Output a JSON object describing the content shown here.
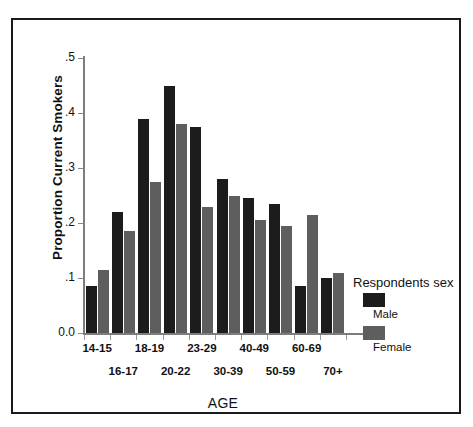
{
  "chart_data": {
    "type": "bar",
    "title": "",
    "xlabel": "AGE",
    "ylabel": "Proportion Current Smokers",
    "categories": [
      "14-15",
      "16-17",
      "18-19",
      "20-22",
      "23-29",
      "30-39",
      "40-49",
      "50-59",
      "60-69",
      "70+"
    ],
    "series": [
      {
        "name": "Male",
        "color": "#1c1c1c",
        "values": [
          0.085,
          0.22,
          0.39,
          0.45,
          0.375,
          0.28,
          0.245,
          0.235,
          0.085,
          0.1
        ]
      },
      {
        "name": "Female",
        "color": "#5e5e5e",
        "values": [
          0.115,
          0.185,
          0.275,
          0.38,
          0.23,
          0.25,
          0.205,
          0.195,
          0.215,
          0.11
        ]
      }
    ],
    "ylim": [
      0.0,
      0.5
    ],
    "yticks": [
      0.0,
      0.1,
      0.2,
      0.3,
      0.4,
      0.5
    ],
    "ytick_labels": [
      "0.0",
      ".1",
      ".2",
      ".3",
      ".4",
      ".5"
    ],
    "grid": false,
    "legend_position": "right",
    "legend_title": "Respondents sex"
  },
  "legend": {
    "title": "Respondents sex",
    "entries": [
      {
        "label": "Male",
        "swatch": "male-swatch"
      },
      {
        "label": "Female",
        "swatch": "female-swatch"
      }
    ]
  },
  "axes": {
    "y_title": "Proportion Current Smokers",
    "x_title": "AGE"
  }
}
